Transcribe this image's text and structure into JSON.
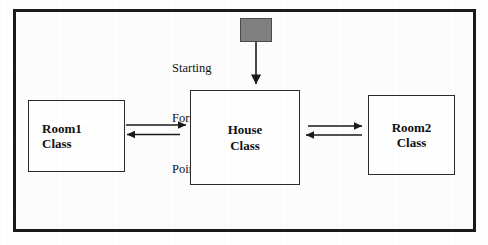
{
  "diagram": {
    "title_text": "",
    "frame": {
      "border_color": "#1a1a1a",
      "background": "#fdfdfd"
    },
    "pointer": {
      "label_line1": "Starting",
      "label_line2": "Form",
      "label_line3": "Pointer",
      "box_fill": "#808080",
      "box_border": "#4a4a4a"
    },
    "nodes": [
      {
        "id": "room1",
        "line1": "Room1",
        "line2": "Class"
      },
      {
        "id": "house",
        "line1": "House",
        "line2": "Class"
      },
      {
        "id": "room2",
        "line1": "Room2",
        "line2": "Class"
      }
    ],
    "connectors": [
      {
        "name": "room1-to-house",
        "direction": "right"
      },
      {
        "name": "house-to-room1",
        "direction": "left"
      },
      {
        "name": "house-to-room2",
        "direction": "right"
      },
      {
        "name": "room2-to-house",
        "direction": "left"
      },
      {
        "name": "pointer-to-house",
        "direction": "down"
      }
    ],
    "stroke_color": "#1a1a1a"
  }
}
